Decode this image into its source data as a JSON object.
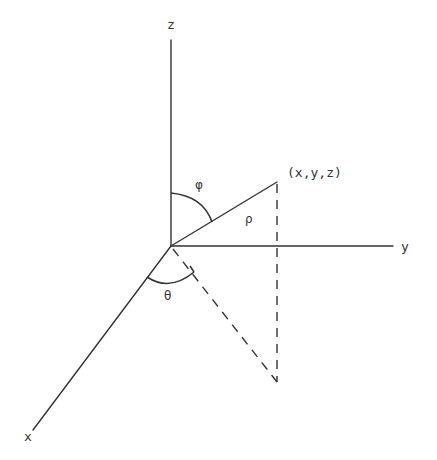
{
  "diagram": {
    "colors": {
      "ink": "#333333",
      "background": "#ffffff"
    },
    "labels": {
      "z_axis": "z",
      "y_axis": "y",
      "x_axis": "x",
      "point": "(x,y,z)",
      "rho": "ρ",
      "phi": "φ",
      "theta": "θ"
    },
    "geometry": {
      "origin": [
        171,
        246
      ],
      "z_axis_end": [
        171,
        40
      ],
      "y_axis_end": [
        393,
        246
      ],
      "x_axis_end": [
        33,
        430
      ],
      "point": [
        277,
        182
      ],
      "projection": [
        277,
        382
      ]
    }
  }
}
